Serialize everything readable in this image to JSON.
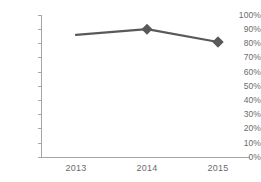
{
  "chart_data": {
    "type": "line",
    "title": "",
    "subtitle": "",
    "xlabel": "",
    "ylabel": "",
    "categories": [
      "2013",
      "2014",
      "2015"
    ],
    "values": [
      86,
      90,
      81
    ],
    "series": [
      {
        "name": "",
        "values": [
          86,
          90,
          81
        ]
      }
    ],
    "ytick_labels": [
      "100%",
      "90%",
      "80%",
      "70%",
      "60%",
      "50%",
      "40%",
      "30%",
      "20%",
      "10%",
      "0%"
    ],
    "ytick_values": [
      100,
      90,
      80,
      70,
      60,
      50,
      40,
      30,
      20,
      10,
      0
    ],
    "ylim": [
      0,
      100
    ],
    "grid": false,
    "legend": "none",
    "marker": "diamond",
    "colors": {
      "line": "#595959",
      "marker": "#595959",
      "axis": "#a6a6a6",
      "tick_text": "#6b6b6b",
      "background": "#ffffff"
    }
  },
  "geometry": {
    "plot_left": 41,
    "plot_right": 250,
    "plot_top": 15,
    "plot_bottom": 157,
    "point_x": [
      76,
      147,
      218
    ],
    "point_y": [
      33,
      26,
      42
    ],
    "ytick_y": [
      15,
      29.2,
      43.4,
      57.6,
      71.8,
      86,
      100.2,
      114.4,
      128.6,
      142.8,
      157
    ],
    "xtick_label_y": 163
  }
}
